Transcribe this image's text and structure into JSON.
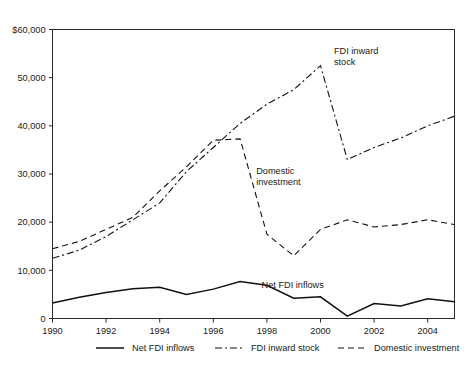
{
  "chart_data": {
    "type": "line",
    "title": "",
    "subtitle": "",
    "xlabel": "",
    "ylabel": "",
    "xlim": [
      1990,
      2005
    ],
    "ylim": [
      0,
      60000
    ],
    "grid": false,
    "legend_position": "bottom",
    "y_ticks": [
      {
        "value": 0,
        "label": "0"
      },
      {
        "value": 10000,
        "label": "10,000"
      },
      {
        "value": 20000,
        "label": "20,000"
      },
      {
        "value": 30000,
        "label": "30,000"
      },
      {
        "value": 40000,
        "label": "40,000"
      },
      {
        "value": 50000,
        "label": "50,000"
      },
      {
        "value": 60000,
        "label": "$60,000"
      }
    ],
    "x_ticks": [
      {
        "value": 1990,
        "label": "1990"
      },
      {
        "value": 1992,
        "label": "1992"
      },
      {
        "value": 1994,
        "label": "1994"
      },
      {
        "value": 1996,
        "label": "1996"
      },
      {
        "value": 1998,
        "label": "1998"
      },
      {
        "value": 2000,
        "label": "2000"
      },
      {
        "value": 2002,
        "label": "2002"
      },
      {
        "value": 2004,
        "label": "2004"
      }
    ],
    "x": [
      1990,
      1991,
      1992,
      1993,
      1994,
      1995,
      1996,
      1997,
      1998,
      1999,
      2000,
      2001,
      2002,
      2003,
      2004,
      2005
    ],
    "series": [
      {
        "name": "Net FDI inflows",
        "style": "solid",
        "color": "#111111",
        "values": [
          3200,
          4400,
          5400,
          6200,
          6500,
          5000,
          6100,
          7700,
          6900,
          4200,
          4500,
          500,
          3100,
          2600,
          4100,
          3500
        ]
      },
      {
        "name": "FDI inward stock",
        "style": "dashdot",
        "color": "#111111",
        "values": [
          12500,
          14200,
          17000,
          20500,
          24000,
          30500,
          35500,
          40500,
          44500,
          47500,
          52500,
          33000,
          35500,
          37500,
          40000,
          42000
        ]
      },
      {
        "name": "Domestic investment",
        "style": "dashed",
        "color": "#111111",
        "values": [
          14500,
          16000,
          18500,
          21000,
          26500,
          31500,
          37000,
          37300,
          17500,
          13000,
          18500,
          20500,
          19000,
          19500,
          20500,
          19500
        ]
      }
    ],
    "annotations": [
      {
        "text_line1": "FDI inward",
        "text_line2": "stock",
        "x": 2000.5,
        "y": 55000
      },
      {
        "text_line1": "Domestic",
        "text_line2": "investment",
        "x": 1997.6,
        "y": 30000
      },
      {
        "text_line1": "Net FDI inflows",
        "text_line2": "",
        "x": 1997.8,
        "y": 6400
      }
    ],
    "legend": [
      {
        "label": "Net FDI inflows",
        "style": "solid"
      },
      {
        "label": "FDI inward stock",
        "style": "dashdot"
      },
      {
        "label": "Domestic investment",
        "style": "dashed"
      }
    ]
  }
}
